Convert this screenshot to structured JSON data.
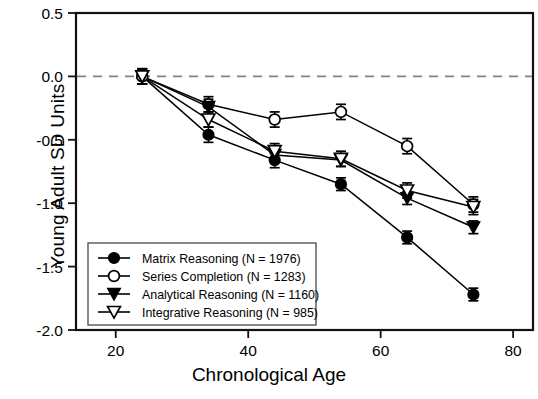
{
  "chart_data": {
    "type": "line",
    "title": "",
    "xlabel": "Chronological Age",
    "ylabel": "Young Adult SD Units",
    "xlim": [
      14,
      83
    ],
    "ylim": [
      -2.0,
      0.5
    ],
    "xticks": [
      "20",
      "40",
      "60",
      "80"
    ],
    "xtick_values": [
      20,
      40,
      60,
      80
    ],
    "yticks": [
      "0.5",
      "0.0",
      "-0.5",
      "-1.0",
      "-1.5",
      "-2.0"
    ],
    "ytick_values": [
      0.5,
      0.0,
      -0.5,
      -1.0,
      -1.5,
      -2.0
    ],
    "grid": false,
    "reference_line": {
      "y": 0.0,
      "style": "dashed"
    },
    "legend_position": "lower-left",
    "x": [
      24,
      34,
      44,
      54,
      64,
      74
    ],
    "series": [
      {
        "name": "Matrix Reasoning (N = 1976)",
        "marker": "filled-circle",
        "n": 1976,
        "values": [
          0.0,
          -0.46,
          -0.66,
          -0.85,
          -1.27,
          -1.72
        ],
        "errors": [
          0.06,
          0.06,
          0.06,
          0.05,
          0.05,
          0.05
        ]
      },
      {
        "name": "Series Completion (N = 1283)",
        "marker": "open-circle",
        "n": 1283,
        "values": [
          0.0,
          -0.22,
          -0.34,
          -0.28,
          -0.55,
          -1.01
        ],
        "errors": [
          0.06,
          0.06,
          0.06,
          0.06,
          0.06,
          0.06
        ]
      },
      {
        "name": "Analytical Reasoning (N = 1160)",
        "marker": "filled-triangle-down",
        "n": 1160,
        "values": [
          0.0,
          -0.24,
          -0.62,
          -0.66,
          -0.96,
          -1.19
        ],
        "errors": [
          0.06,
          0.06,
          0.06,
          0.05,
          0.05,
          0.05
        ]
      },
      {
        "name": "Integrative Reasoning (N = 985)",
        "marker": "open-triangle-down",
        "n": 985,
        "values": [
          0.0,
          -0.34,
          -0.59,
          -0.65,
          -0.9,
          -1.03
        ],
        "errors": [
          0.06,
          0.06,
          0.06,
          0.06,
          0.06,
          0.06
        ]
      }
    ],
    "colors": {
      "line": "#000000",
      "marker_fill": "#000000",
      "marker_open": "#ffffff",
      "reference": "#808080"
    }
  },
  "axis": {
    "ylabel": "Young Adult SD Units",
    "xlabel": "Chronological Age"
  },
  "legend": {
    "items": [
      {
        "label": "Matrix Reasoning (N = 1976)"
      },
      {
        "label": "Series Completion (N = 1283)"
      },
      {
        "label": "Analytical Reasoning (N = 1160)"
      },
      {
        "label": "Integrative Reasoning (N = 985)"
      }
    ]
  }
}
